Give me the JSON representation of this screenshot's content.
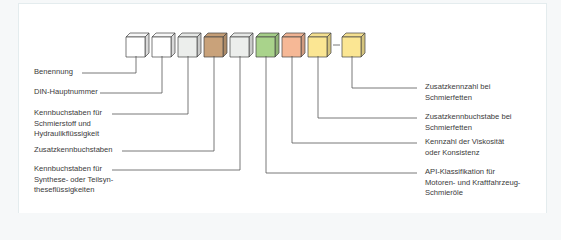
{
  "diagram": {
    "cubes": [
      {
        "id": "c1",
        "color": "#ffffff"
      },
      {
        "id": "c2",
        "color": "#ffffff"
      },
      {
        "id": "c3",
        "color": "#eceeec"
      },
      {
        "id": "c4",
        "color": "#c9a27a"
      },
      {
        "id": "c5",
        "color": "#eceeec"
      },
      {
        "id": "c6",
        "color": "#a9d38b"
      },
      {
        "id": "c7",
        "color": "#f6b896"
      },
      {
        "id": "c8",
        "color": "#fbe693"
      },
      {
        "id": "c9",
        "color": "#fbe693"
      }
    ],
    "separator": "–",
    "labels_left": [
      {
        "text": "Benennung"
      },
      {
        "text": "DIN-Hauptnummer"
      },
      {
        "text": "Kennbuchstaben für\nSchmierstoff und\nHydraulikflüssigkeit"
      },
      {
        "text": "Zusatzkennbuchstaben"
      },
      {
        "text": "Kennbuchstaben für\nSynthese- oder Teilsyn-\ntheseflüssigkeiten"
      }
    ],
    "labels_right": [
      {
        "text": "Zusatzkennzahl bei\nSchmierfetten"
      },
      {
        "text": "Zusatzkennbuchstabe bei\nSchmierfetten"
      },
      {
        "text": "Kennzahl der Viskosität\noder Konsistenz"
      },
      {
        "text": "API-Klassifikation für\nMotoren- und Kraftfahrzeug-\nSchmieröle"
      }
    ]
  }
}
